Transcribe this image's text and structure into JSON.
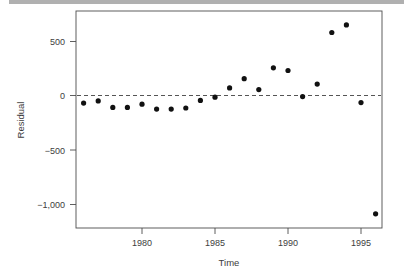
{
  "figure": {
    "background_color": "#ffffff",
    "top_band_color": "#b0b0b0",
    "point_color": "#111111",
    "axis_color": "#4d4d4d",
    "reference_line_color": "#555555"
  },
  "chart_data": {
    "type": "scatter",
    "title": "",
    "subtitle": "",
    "xlabel": "Time",
    "ylabel": "Residual",
    "xlim": [
      1975.3,
      1996.7
    ],
    "ylim": [
      -1120,
      700
    ],
    "xticks": [
      1980,
      1985,
      1990,
      1995
    ],
    "xticklabels": [
      "1980",
      "1985",
      "1990",
      "1995"
    ],
    "yticks": [
      500,
      0,
      -500,
      -1000
    ],
    "yticklabels": [
      "500",
      "0",
      "−500",
      "−1,000"
    ],
    "grid": false,
    "legend": null,
    "annotations": [
      {
        "kind": "reference-line",
        "orientation": "horizontal",
        "value": 0,
        "style": "dashed"
      }
    ],
    "x": [
      1976,
      1977,
      1978,
      1979,
      1980,
      1981,
      1982,
      1983,
      1984,
      1985,
      1986,
      1987,
      1988,
      1989,
      1990,
      1991,
      1992,
      1993,
      1994,
      1995,
      1996
    ],
    "values": [
      -70,
      -50,
      -110,
      -110,
      -80,
      -125,
      -125,
      -115,
      -45,
      -15,
      70,
      155,
      55,
      255,
      230,
      -10,
      105,
      580,
      650,
      -65,
      -1090
    ],
    "series": [
      {
        "name": "Residual",
        "marker": "filled-circle",
        "color": "#111111",
        "x": [
          1976,
          1977,
          1978,
          1979,
          1980,
          1981,
          1982,
          1983,
          1984,
          1985,
          1986,
          1987,
          1988,
          1989,
          1990,
          1991,
          1992,
          1993,
          1994,
          1995,
          1996
        ],
        "values": [
          -70,
          -50,
          -110,
          -110,
          -80,
          -125,
          -125,
          -115,
          -45,
          -15,
          70,
          155,
          55,
          255,
          230,
          -10,
          105,
          580,
          650,
          -65,
          -1090
        ]
      }
    ]
  },
  "axes": {
    "x_title": "Time",
    "y_title": "Residual",
    "x_tick_labels": [
      "1980",
      "1985",
      "1990",
      "1995"
    ],
    "y_tick_labels": [
      "500",
      "0",
      "−500",
      "−1,000"
    ]
  }
}
